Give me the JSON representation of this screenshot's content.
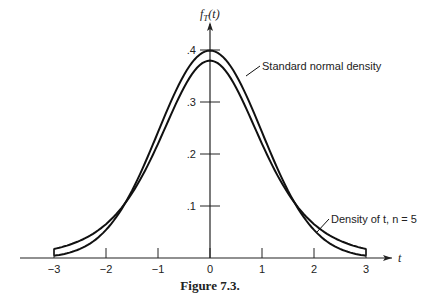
{
  "chart_data": {
    "type": "line",
    "title": "",
    "caption": "Figure 7.3.",
    "xlabel": "t",
    "ylabel": "f_T(t)",
    "xlim": [
      -3,
      3
    ],
    "ylim": [
      0,
      0.4
    ],
    "x_ticks": [
      "-3",
      "-2",
      "-1",
      "0",
      "1",
      "2",
      "3"
    ],
    "y_ticks": [
      ".1",
      ".2",
      ".3",
      ".4"
    ],
    "grid": false,
    "series": [
      {
        "name": "Standard normal density",
        "x": [
          -3,
          -2.5,
          -2,
          -1.5,
          -1,
          -0.5,
          0,
          0.5,
          1,
          1.5,
          2,
          2.5,
          3
        ],
        "values": [
          0.0044,
          0.0175,
          0.054,
          0.1295,
          0.242,
          0.3521,
          0.3989,
          0.3521,
          0.242,
          0.1295,
          0.054,
          0.0175,
          0.0044
        ]
      },
      {
        "name": "Density of t, n = 5",
        "x": [
          -3,
          -2.5,
          -2,
          -1.5,
          -1,
          -0.5,
          0,
          0.5,
          1,
          1.5,
          2,
          2.5,
          3
        ],
        "values": [
          0.0173,
          0.0269,
          0.0651,
          0.1245,
          0.2197,
          0.3279,
          0.3796,
          0.3279,
          0.2197,
          0.1245,
          0.0651,
          0.0269,
          0.0173
        ]
      }
    ],
    "annotations": [
      {
        "text": "Standard normal density",
        "points_to": "upper curve near t=0.5"
      },
      {
        "text": "Density of t, n = 5",
        "points_to": "tail near t=2"
      }
    ]
  },
  "labels": {
    "ylabel_f": "f",
    "ylabel_sub": "T",
    "ylabel_arg": "(t)",
    "xlabel": "t",
    "caption": "Figure 7.3.",
    "anno_normal": "Standard normal density",
    "anno_t": "Density of t, n = 5"
  }
}
